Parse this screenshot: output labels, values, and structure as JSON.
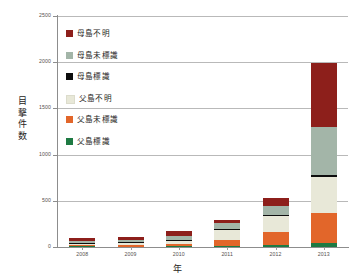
{
  "chart_data": {
    "type": "bar",
    "subtype": "stacked-bar",
    "title": "",
    "xlabel": "年",
    "ylabel": "目撃件数",
    "categories": [
      "2008",
      "2009",
      "2010",
      "2011",
      "2012",
      "2013"
    ],
    "ylim": [
      0,
      2500
    ],
    "yticks": [
      0,
      500,
      1000,
      1500,
      2000,
      2500
    ],
    "ytick_labels": [
      "0",
      "500",
      "1000",
      "1500",
      "2000",
      "2500"
    ],
    "grid": true,
    "grid_axis": "y",
    "legend_position": "upper-left-inside",
    "series": [
      {
        "name": "父島標識",
        "color": "#1e7a43",
        "values": [
          6,
          5,
          8,
          12,
          22,
          48
        ]
      },
      {
        "name": "父島未標識",
        "color": "#e2662a",
        "values": [
          12,
          14,
          22,
          62,
          137,
          318
        ]
      },
      {
        "name": "父島不明",
        "color": "#e8e8d8",
        "values": [
          22,
          28,
          44,
          108,
          176,
          396
        ]
      },
      {
        "name": "母島標識",
        "color": "#0d0d0d",
        "values": [
          3,
          4,
          6,
          9,
          14,
          22
        ]
      },
      {
        "name": "母島未標識",
        "color": "#a3b5a8",
        "values": [
          18,
          22,
          38,
          67,
          97,
          520
        ]
      },
      {
        "name": "母島不明",
        "color": "#8d1f1b",
        "values": [
          34,
          38,
          58,
          31,
          83,
          691
        ]
      }
    ],
    "totals": [
      95,
      111,
      176,
      289,
      529,
      1995
    ]
  },
  "axis": {
    "y_title": "目撃件数",
    "x_title": "年"
  },
  "legend": {
    "items": [
      {
        "label": "母島不明",
        "color": "#8d1f1b",
        "swatch_name": "legend-swatch-hahajima-unknown"
      },
      {
        "label": "母島未標識",
        "color": "#a3b5a8",
        "swatch_name": "legend-swatch-hahajima-untagged"
      },
      {
        "label": "母島標識",
        "color": "#0d0d0d",
        "swatch_name": "legend-swatch-hahajima-tagged"
      },
      {
        "label": "父島不明",
        "color": "#e8e8d8",
        "swatch_name": "legend-swatch-chichijima-unknown"
      },
      {
        "label": "父島未標識",
        "color": "#e2662a",
        "swatch_name": "legend-swatch-chichijima-untagged"
      },
      {
        "label": "父島標識",
        "color": "#1e7a43",
        "swatch_name": "legend-swatch-chichijima-tagged"
      }
    ]
  },
  "colors": {
    "axis": "#8d8d8d",
    "grid": "#b9b9b9",
    "text": "#55514e",
    "background": "#ffffff"
  }
}
